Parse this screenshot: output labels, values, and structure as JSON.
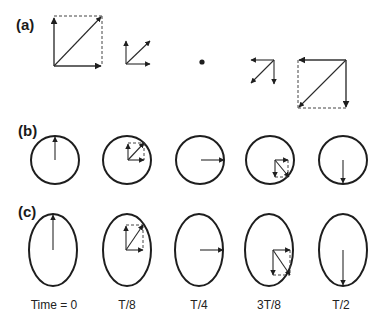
{
  "figure": {
    "panels": {
      "a": {
        "label": "(a)"
      },
      "b": {
        "label": "(b)"
      },
      "c": {
        "label": "(c)"
      }
    },
    "time_labels": [
      "Time = 0",
      "T/8",
      "T/4",
      "3T/8",
      "T/2"
    ],
    "colors": {
      "stroke": "#1e1e1e",
      "background": "#ffffff"
    }
  }
}
